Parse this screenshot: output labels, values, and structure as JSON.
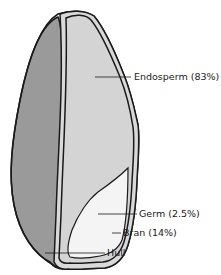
{
  "diagram": {
    "labels": [
      {
        "id": "endosperm",
        "text": "Endosperm (83%)"
      },
      {
        "id": "germ",
        "text": "Germ (2.5%)"
      },
      {
        "id": "bran",
        "text": "Bran (14%)"
      },
      {
        "id": "hull",
        "text": "Hull"
      }
    ],
    "colors": {
      "hull": "#9a9a9a",
      "endosperm": "#d6d6d6",
      "germ": "#f3f3f3",
      "bran": "#c8c8c8",
      "outline": "#1a1a1a"
    }
  }
}
